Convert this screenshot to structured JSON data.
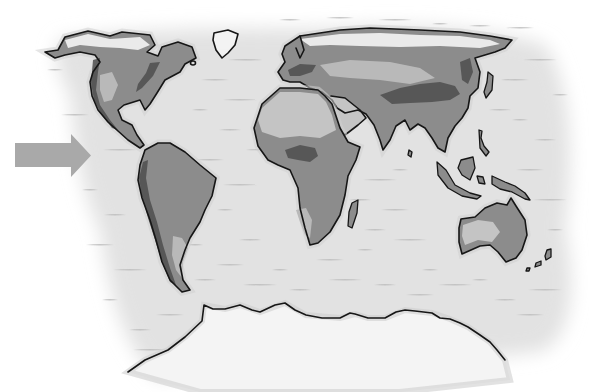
{
  "figure": {
    "type": "world-map-illustration",
    "style": "grayscale hand-drawn physical map",
    "caption": ""
  },
  "colors": {
    "background": "#ffffff",
    "ocean": "#e2e2e2",
    "ocean_halo": "#cfcfcf",
    "wave_marks": "#bdbdbd",
    "land": "#8c8c8c",
    "lowland_light": "#b9b9b9",
    "desert": "#c4c4c4",
    "mountains": "#4e4e4e",
    "ice": "#f4f4f4",
    "coastline": "#161616",
    "arrow": "#a9a9a9"
  },
  "arrow": {
    "direction": "right",
    "label": "",
    "points_to": "west coast of the Americas"
  },
  "regions": [
    {
      "name": "North America",
      "feature": "continent"
    },
    {
      "name": "Greenland",
      "feature": "island"
    },
    {
      "name": "South America",
      "feature": "continent"
    },
    {
      "name": "Europe",
      "feature": "continent"
    },
    {
      "name": "Africa",
      "feature": "continent"
    },
    {
      "name": "Madagascar",
      "feature": "island"
    },
    {
      "name": "Arabian Peninsula",
      "feature": "peninsula"
    },
    {
      "name": "Asia",
      "feature": "continent"
    },
    {
      "name": "India",
      "feature": "subcontinent"
    },
    {
      "name": "Southeast Asian islands",
      "feature": "archipelago"
    },
    {
      "name": "Japan",
      "feature": "island"
    },
    {
      "name": "Australia",
      "feature": "continent"
    },
    {
      "name": "New Zealand",
      "feature": "island"
    },
    {
      "name": "Antarctica",
      "feature": "continent"
    }
  ]
}
